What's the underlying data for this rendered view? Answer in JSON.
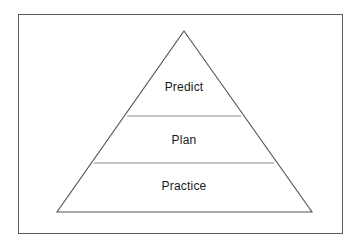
{
  "diagram": {
    "type": "pyramid",
    "title": "",
    "background_color": "#ffffff",
    "frame": {
      "name": "outer-border",
      "stroke_color": "#5e5e5e",
      "fill_color": "#ffffff"
    },
    "shape": {
      "apex": {
        "x": 184,
        "y": 31
      },
      "base_left": {
        "x": 57,
        "y": 212
      },
      "base_right": {
        "x": 312,
        "y": 212
      },
      "edge_color": "#555555",
      "fill_color": "#ffffff",
      "divider_color": "#8a8a8a"
    },
    "tiers": [
      {
        "id": "predict",
        "label": "Predict",
        "level": 1,
        "position": "top",
        "label_x": 184,
        "label_y": 87,
        "divider_y": 116,
        "divider_left_x": 127,
        "divider_right_x": 241
      },
      {
        "id": "plan",
        "label": "Plan",
        "level": 2,
        "position": "middle",
        "label_x": 184,
        "label_y": 140,
        "divider_y": 163,
        "divider_left_x": 94,
        "divider_right_x": 274
      },
      {
        "id": "practice",
        "label": "Practice",
        "level": 3,
        "position": "bottom",
        "label_x": 184,
        "label_y": 186,
        "divider_y": null,
        "divider_left_x": null,
        "divider_right_x": null
      }
    ]
  }
}
